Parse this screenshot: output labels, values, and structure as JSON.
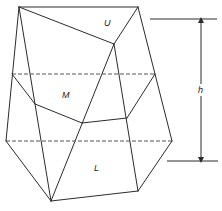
{
  "diagram": {
    "type": "prism-section-volume",
    "labels": {
      "upper": "U",
      "middle": "M",
      "lower": "L",
      "height": "h"
    },
    "colors": {
      "line": "#2b2b2b",
      "dashed": "#555555",
      "background": "#ffffff"
    },
    "vertices": {
      "A": [
        19,
        7
      ],
      "B": [
        138,
        7
      ],
      "C": [
        114,
        44
      ],
      "D": [
        35,
        104
      ],
      "E": [
        82,
        123
      ],
      "F": [
        127,
        118
      ],
      "G": [
        6,
        141
      ],
      "H": [
        172,
        141
      ],
      "I": [
        51,
        201
      ],
      "J": [
        138,
        191
      ]
    },
    "mid_section_y": 74,
    "lower_section_y": 141,
    "dimension": {
      "top_y": 19,
      "bottom_y": 161,
      "arrow_x": 201
    }
  }
}
